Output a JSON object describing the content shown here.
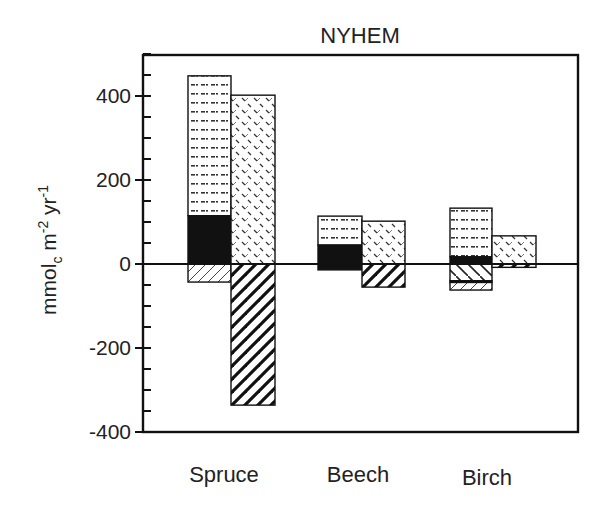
{
  "chart_data": {
    "type": "bar",
    "subtype": "stacked-paired",
    "title": "NYHEM",
    "xlabel": "",
    "ylabel": "mmolc m-2 yr-1",
    "ylabel_parts": {
      "main": "mmol",
      "sub": "c",
      "mid": " m",
      "sup1": "-2",
      "mid2": " yr",
      "sup2": "-1"
    },
    "ylim": [
      -400,
      500
    ],
    "yticks": [
      -400,
      -200,
      0,
      200,
      400
    ],
    "ytick_labels": [
      "-400",
      "-200",
      "0",
      "200",
      "400"
    ],
    "minor_tick_step": 50,
    "grid": false,
    "legend": null,
    "categories": [
      "Spruce",
      "Beech",
      "Birch"
    ],
    "bars": [
      {
        "category": "Spruce",
        "position": "left",
        "segments": [
          {
            "pattern": "dotted",
            "from": 115,
            "to": 448
          },
          {
            "pattern": "solid-black",
            "from": 0,
            "to": 115
          },
          {
            "pattern": "hatch-light-forward",
            "from": -43,
            "to": 0
          }
        ]
      },
      {
        "category": "Spruce",
        "position": "right",
        "segments": [
          {
            "pattern": "dash-diagonal",
            "from": 0,
            "to": 402
          },
          {
            "pattern": "hatch-heavy-forward",
            "from": -336,
            "to": 0
          }
        ]
      },
      {
        "category": "Beech",
        "position": "left",
        "segments": [
          {
            "pattern": "dotted",
            "from": 45,
            "to": 114
          },
          {
            "pattern": "solid-black",
            "from": -14,
            "to": 45
          }
        ]
      },
      {
        "category": "Beech",
        "position": "right",
        "segments": [
          {
            "pattern": "dash-diagonal",
            "from": 0,
            "to": 102
          },
          {
            "pattern": "hatch-heavy-forward",
            "from": -55,
            "to": 0
          }
        ]
      },
      {
        "category": "Birch",
        "position": "left",
        "segments": [
          {
            "pattern": "dotted",
            "from": 17,
            "to": 133
          },
          {
            "pattern": "solid-black",
            "from": 0,
            "to": 17
          },
          {
            "pattern": "hatch-back",
            "from": -40,
            "to": 0
          },
          {
            "pattern": "solid-black",
            "from": -44,
            "to": -40
          },
          {
            "pattern": "hatch-light-forward",
            "from": -62,
            "to": -44
          }
        ]
      },
      {
        "category": "Birch",
        "position": "right",
        "segments": [
          {
            "pattern": "dash-diagonal",
            "from": 0,
            "to": 67
          },
          {
            "pattern": "hatch-heavy-forward",
            "from": -8,
            "to": 0
          }
        ]
      }
    ]
  },
  "layout": {
    "frame": {
      "left": 143,
      "right": 578,
      "top": 55,
      "bottom": 432
    },
    "zero_y": 264,
    "px_per_unit": 0.42,
    "bar_x": [
      [
        188,
        231
      ],
      [
        231,
        275
      ],
      [
        318,
        362
      ],
      [
        362,
        405
      ],
      [
        450,
        492
      ],
      [
        492,
        536
      ]
    ],
    "category_centers": [
      224,
      358,
      487
    ]
  }
}
